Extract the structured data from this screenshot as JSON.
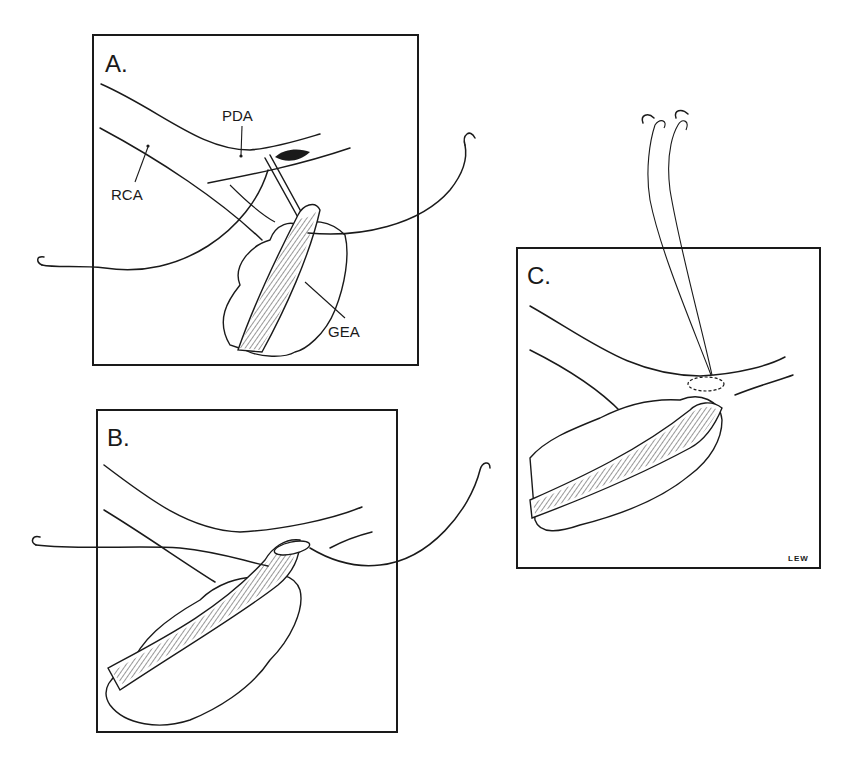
{
  "figure": {
    "panels": [
      {
        "id": "A",
        "label": "A.",
        "annotations": [
          {
            "text": "PDA"
          },
          {
            "text": "RCA"
          },
          {
            "text": "GEA"
          }
        ]
      },
      {
        "id": "B",
        "label": "B.",
        "annotations": []
      },
      {
        "id": "C",
        "label": "C.",
        "annotations": [],
        "signature": "LEW"
      }
    ],
    "colors": {
      "line": "#1a1a1a",
      "background": "#ffffff"
    }
  }
}
